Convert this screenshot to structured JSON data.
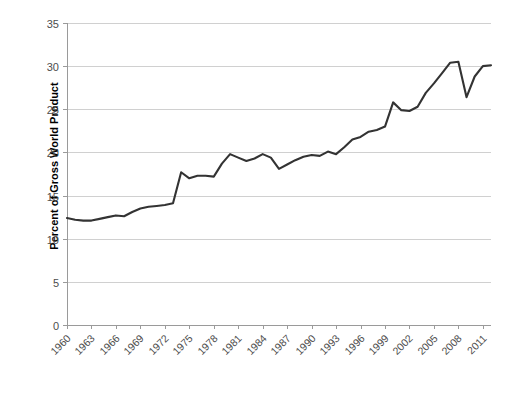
{
  "chart_data": {
    "type": "line",
    "title": "",
    "xlabel": "",
    "ylabel": "Percent of Gross World Product",
    "ylim": [
      0,
      35
    ],
    "ytick_step": 5,
    "yticks": [
      "0",
      "5",
      "10",
      "15",
      "20",
      "25",
      "30",
      "35"
    ],
    "xticks": [
      "1960",
      "1963",
      "1966",
      "1969",
      "1972",
      "1975",
      "1978",
      "1981",
      "1984",
      "1987",
      "1990",
      "1993",
      "1996",
      "1999",
      "2002",
      "2005",
      "2008",
      "2011"
    ],
    "xtick_step_years": 3,
    "xlim": [
      1960,
      2012
    ],
    "grid": "horizontal",
    "legend": "none",
    "line_color": "#333333",
    "gridline_color": "#d0d0d0",
    "axis_color": "#9a9a9a",
    "tick_label_color": "#4d4d4d",
    "x": [
      1960,
      1961,
      1962,
      1963,
      1964,
      1965,
      1966,
      1967,
      1968,
      1969,
      1970,
      1971,
      1972,
      1973,
      1974,
      1975,
      1976,
      1977,
      1978,
      1979,
      1980,
      1981,
      1982,
      1983,
      1984,
      1985,
      1986,
      1987,
      1988,
      1989,
      1990,
      1991,
      1992,
      1993,
      1994,
      1995,
      1996,
      1997,
      1998,
      1999,
      2000,
      2001,
      2002,
      2003,
      2004,
      2005,
      2006,
      2007,
      2008,
      2009,
      2010,
      2011,
      2012
    ],
    "values": [
      12.4,
      12.2,
      12.1,
      12.1,
      12.3,
      12.5,
      12.7,
      12.6,
      13.1,
      13.5,
      13.7,
      13.8,
      13.9,
      14.1,
      17.7,
      17.0,
      17.3,
      17.3,
      17.2,
      18.7,
      19.8,
      19.4,
      19.0,
      19.3,
      19.8,
      19.4,
      18.1,
      18.6,
      19.1,
      19.5,
      19.7,
      19.6,
      20.1,
      19.8,
      20.6,
      21.5,
      21.8,
      22.4,
      22.6,
      23.0,
      25.8,
      24.9,
      24.8,
      25.3,
      26.9,
      28.0,
      29.2,
      30.4,
      30.5,
      26.4,
      28.8,
      30.0,
      30.1
    ],
    "series_name": "World trade as percent of gross world product",
    "annotations": []
  },
  "plot_geometry": {
    "left": 67,
    "right": 491,
    "top": 23,
    "bottom": 325
  }
}
